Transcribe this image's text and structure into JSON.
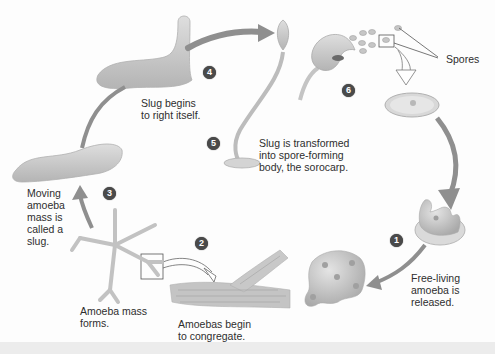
{
  "diagram": {
    "type": "life-cycle",
    "colors": {
      "structure_fill": "#c8c8c8",
      "structure_stroke": "#a8a8a8",
      "arrow": "#8f8f8f",
      "badge": "#4a4a4a",
      "text": "#2e2e2e"
    },
    "steps": [
      {
        "number": "1",
        "label": "Free-living\namoeba is\nreleased."
      },
      {
        "number": "2",
        "label": "Amoebas begin\nto congregate."
      },
      {
        "number": "3",
        "label": "Moving\namoeba\nmass is\ncalled a\nslug."
      },
      {
        "number": "4",
        "label": "Slug begins\nto right itself."
      },
      {
        "number": "5",
        "label": "Slug is transformed\ninto spore-forming\nbody, the sorocarp."
      },
      {
        "number": "6",
        "label": ""
      }
    ],
    "extra_labels": {
      "amoeba_mass": "Amoeba mass\nforms.",
      "spores": "Spores"
    }
  }
}
